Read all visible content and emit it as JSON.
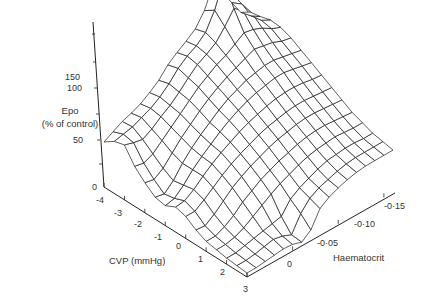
{
  "chart_data": {
    "type": "surface3d",
    "title": "",
    "zlabel_line1": "Epo",
    "zlabel_line2": "(% of control)",
    "xlabel": "CVP (mmHg)",
    "ylabel": "Haematocrit",
    "z_ticks": [
      "0",
      "50",
      "100",
      "150"
    ],
    "x_ticks": [
      "-4",
      "-3",
      "-2",
      "-1",
      "0",
      "1",
      "2",
      "3"
    ],
    "y_ticks": [
      "0",
      "-0·05",
      "-0·10",
      "-0·15"
    ],
    "x_range": [
      -4,
      3
    ],
    "y_range": [
      0,
      -0.16
    ],
    "z_range": [
      0,
      160
    ],
    "grid_rows_x": [
      -4,
      -3.5,
      -3,
      -2.5,
      -2,
      -1.5,
      -1,
      -0.5,
      0,
      0.5,
      1,
      1.5,
      2,
      2.5,
      3
    ],
    "grid_cols_y": [
      0,
      -0.01,
      -0.02,
      -0.03,
      -0.04,
      -0.05,
      -0.06,
      -0.07,
      -0.08,
      -0.09,
      -0.1,
      -0.11,
      -0.12,
      -0.13,
      -0.14,
      -0.15,
      -0.16
    ],
    "z_values": [
      [
        45,
        50,
        55,
        58,
        62,
        68,
        75,
        85,
        92,
        98,
        105,
        118,
        140,
        125,
        110,
        95,
        90
      ],
      [
        52,
        54,
        56,
        60,
        64,
        70,
        78,
        88,
        95,
        100,
        108,
        125,
        150,
        130,
        115,
        98,
        92
      ],
      [
        55,
        52,
        50,
        55,
        62,
        68,
        76,
        85,
        93,
        98,
        104,
        115,
        128,
        120,
        112,
        100,
        95
      ],
      [
        40,
        38,
        42,
        50,
        58,
        66,
        74,
        82,
        88,
        94,
        98,
        104,
        110,
        108,
        104,
        98,
        94
      ],
      [
        30,
        28,
        34,
        44,
        54,
        62,
        70,
        77,
        83,
        88,
        92,
        96,
        100,
        98,
        96,
        92,
        90
      ],
      [
        22,
        20,
        28,
        40,
        50,
        58,
        65,
        72,
        78,
        82,
        86,
        88,
        90,
        90,
        88,
        86,
        84
      ],
      [
        20,
        22,
        30,
        40,
        48,
        55,
        62,
        68,
        73,
        77,
        80,
        82,
        84,
        84,
        82,
        80,
        78
      ],
      [
        25,
        26,
        32,
        40,
        47,
        53,
        58,
        63,
        67,
        70,
        73,
        75,
        76,
        76,
        75,
        73,
        72
      ],
      [
        22,
        22,
        28,
        35,
        42,
        48,
        53,
        57,
        61,
        64,
        66,
        68,
        69,
        69,
        68,
        67,
        66
      ],
      [
        15,
        14,
        20,
        28,
        36,
        42,
        47,
        51,
        55,
        58,
        60,
        62,
        63,
        63,
        62,
        61,
        60
      ],
      [
        10,
        10,
        14,
        20,
        28,
        34,
        40,
        44,
        48,
        51,
        54,
        56,
        57,
        57,
        56,
        55,
        54
      ],
      [
        8,
        8,
        10,
        14,
        20,
        26,
        32,
        37,
        41,
        45,
        48,
        50,
        51,
        52,
        51,
        50,
        50
      ],
      [
        6,
        6,
        8,
        10,
        12,
        14,
        16,
        28,
        34,
        38,
        42,
        45,
        46,
        47,
        47,
        46,
        46
      ],
      [
        5,
        5,
        6,
        8,
        10,
        8,
        4,
        20,
        30,
        35,
        38,
        41,
        43,
        44,
        44,
        44,
        44
      ],
      [
        4,
        4,
        5,
        6,
        7,
        6,
        3,
        10,
        26,
        32,
        36,
        39,
        41,
        42,
        42,
        42,
        42
      ]
    ]
  }
}
